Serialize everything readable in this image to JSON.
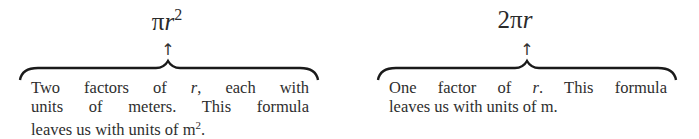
{
  "left": {
    "formula_prefix": "π",
    "formula_var": "r",
    "formula_exp": "2",
    "arrow": "↑",
    "lines": [
      {
        "a": "Two factors of ",
        "v": "r",
        "b": ", each with"
      },
      {
        "a": "units of meters.  This formula"
      },
      {
        "a": "leaves us with units of m",
        "sup": "2",
        "b": "."
      }
    ]
  },
  "right": {
    "formula_prefix": "2π",
    "formula_var": "r",
    "arrow": "↑",
    "lines": [
      {
        "a": "One factor of ",
        "v": "r",
        "b": ".  This formula"
      },
      {
        "a": "leaves us with units of m."
      }
    ]
  }
}
